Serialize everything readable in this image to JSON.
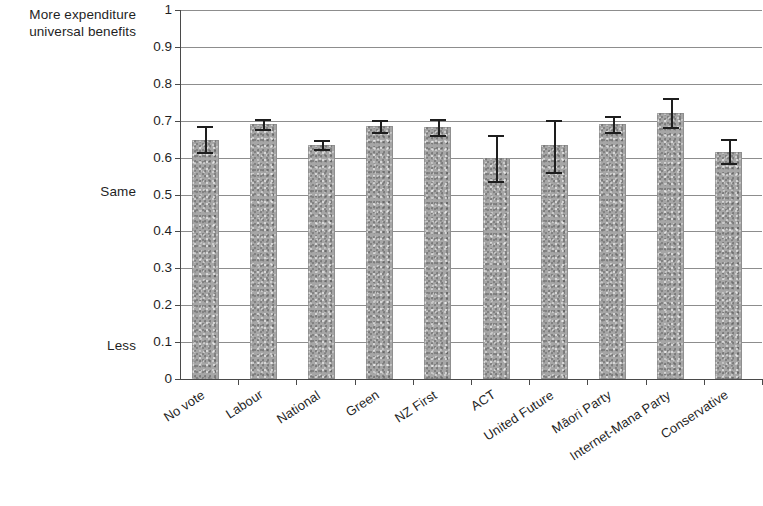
{
  "chart_data": {
    "type": "bar",
    "title": "",
    "subtitle": "",
    "xlabel": "",
    "ylabel": "",
    "ylim": [
      0,
      1
    ],
    "grid": true,
    "legend": "none",
    "error_bars": true,
    "categories": [
      "No vote",
      "Labour",
      "National",
      "Green",
      "NZ First",
      "ACT",
      "United Future",
      "Māori Party",
      "Internet-Mana Party",
      "Conservative"
    ],
    "values": [
      0.648,
      0.691,
      0.634,
      0.686,
      0.683,
      0.599,
      0.634,
      0.691,
      0.721,
      0.615
    ],
    "error_low": [
      0.615,
      0.678,
      0.623,
      0.67,
      0.662,
      0.537,
      0.561,
      0.67,
      0.683,
      0.585
    ],
    "error_high": [
      0.686,
      0.705,
      0.648,
      0.702,
      0.705,
      0.661,
      0.702,
      0.713,
      0.761,
      0.651
    ],
    "y_ticks": [
      "0",
      "0.1",
      "0.2",
      "0.3",
      "0.4",
      "0.5",
      "0.6",
      "0.7",
      "0.8",
      "0.9",
      "1"
    ],
    "y_tick_values": [
      0,
      0.1,
      0.2,
      0.3,
      0.4,
      0.5,
      0.6,
      0.7,
      0.8,
      0.9,
      1
    ],
    "axis_annotations": [
      {
        "text": "More expenditure\nuniversal benefits",
        "value": 1.0
      },
      {
        "text": "Same",
        "value": 0.5
      },
      {
        "text": "Less",
        "value": 0.1
      }
    ],
    "bar_color": "#a6a6a6",
    "error_color": "#1e1e1e",
    "grid_color": "#8d8d8d",
    "axis_color": "#4a4a4a",
    "background": "#ffffff"
  },
  "annotations": {
    "top_left": "More expenditure\nuniversal benefits",
    "middle_left": "Same",
    "bottom_left": "Less"
  }
}
